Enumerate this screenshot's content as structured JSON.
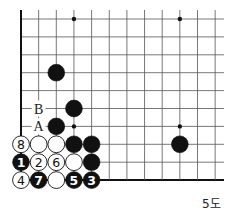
{
  "diagram": {
    "caption": "5도",
    "grid": {
      "origin_x": 21,
      "origin_y": 19,
      "spacing_x": 17.65,
      "spacing_y": 17.9,
      "cols": 12,
      "rows": 10,
      "right_extent": 224,
      "thick_edges": [
        "left",
        "bottom"
      ]
    },
    "star_points": [
      [
        3,
        0
      ],
      [
        9,
        0
      ],
      [
        3,
        6
      ],
      [
        9,
        6
      ]
    ],
    "stones": [
      {
        "col": 2,
        "row": 3,
        "color": "black",
        "label": ""
      },
      {
        "col": 3,
        "row": 5,
        "color": "black",
        "label": ""
      },
      {
        "col": 2,
        "row": 6,
        "color": "black",
        "label": ""
      },
      {
        "col": 0,
        "row": 7,
        "color": "white",
        "label": "8"
      },
      {
        "col": 1,
        "row": 7,
        "color": "white",
        "label": ""
      },
      {
        "col": 2,
        "row": 7,
        "color": "white",
        "label": ""
      },
      {
        "col": 3,
        "row": 7,
        "color": "black",
        "label": ""
      },
      {
        "col": 4,
        "row": 7,
        "color": "black",
        "label": ""
      },
      {
        "col": 9,
        "row": 7,
        "color": "black",
        "label": ""
      },
      {
        "col": 0,
        "row": 8,
        "color": "black",
        "label": "1"
      },
      {
        "col": 1,
        "row": 8,
        "color": "white",
        "label": "2"
      },
      {
        "col": 2,
        "row": 8,
        "color": "white",
        "label": "6"
      },
      {
        "col": 3,
        "row": 8,
        "color": "white",
        "label": ""
      },
      {
        "col": 4,
        "row": 8,
        "color": "black",
        "label": ""
      },
      {
        "col": 0,
        "row": 9,
        "color": "white",
        "label": "4"
      },
      {
        "col": 1,
        "row": 9,
        "color": "black",
        "label": "7"
      },
      {
        "col": 2,
        "row": 9,
        "color": "white",
        "label": ""
      },
      {
        "col": 3,
        "row": 9,
        "color": "black",
        "label": "5"
      },
      {
        "col": 4,
        "row": 9,
        "color": "black",
        "label": "3"
      }
    ],
    "markers": [
      {
        "col": 1,
        "row": 5,
        "text": "B"
      },
      {
        "col": 1,
        "row": 6,
        "text": "A"
      }
    ],
    "colors": {
      "line": "#555555",
      "edge": "#111111",
      "black": "#111111",
      "white": "#ffffff"
    }
  }
}
